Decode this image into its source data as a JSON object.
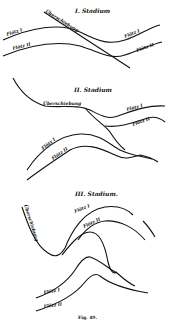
{
  "figure": {
    "caption": "Fig. 49.",
    "stages": [
      {
        "title": "I. Stadium",
        "labels": {
          "fault": "Überschiebung",
          "seam1_left": "Flötz I",
          "seam2_left": "Flötz II",
          "seam1_right": "Flötz I",
          "seam2_right": "Flötz II"
        }
      },
      {
        "title": "II. Stadium",
        "labels": {
          "fault": "Überschiebung",
          "seam1_upper": "Flötz I",
          "seam2_upper": "Flötz II",
          "seam1_lower": "Flötz I",
          "seam2_lower": "Flötz II"
        }
      },
      {
        "title": "III. Stadium.",
        "labels": {
          "fault": "Überschiebung",
          "seam1_upper": "Flötz I",
          "seam2_upper": "Flötz II",
          "seam1_lower": "Flötz I",
          "seam2_lower": "Flötz II"
        }
      }
    ]
  }
}
